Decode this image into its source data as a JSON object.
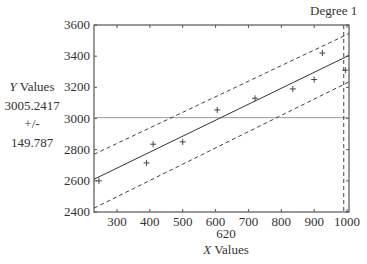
{
  "header": {
    "degree_label": "Degree 1"
  },
  "readout": {
    "y_axis_label_italic": "Y",
    "y_axis_label_rest": " Values",
    "y_value": "3005.2417",
    "plus_minus": "+/-",
    "y_interval": "149.787",
    "x_value": "620",
    "x_axis_label_italic": "X",
    "x_axis_label_rest": " Values"
  },
  "colors": {
    "axis": "#555555",
    "fit": "#333333",
    "bounds": "#444444",
    "crosshair": "#9a9a9a",
    "marker": "#333333"
  },
  "chart_data": {
    "type": "scatter",
    "title": "Degree 1",
    "xlabel": "X Values",
    "ylabel": "Y Values",
    "xlim": [
      230,
      1006
    ],
    "ylim": [
      2400,
      3600
    ],
    "x_ticks": [
      300,
      400,
      500,
      600,
      700,
      800,
      900,
      1000
    ],
    "y_ticks": [
      2400,
      2600,
      2800,
      3000,
      3200,
      3400,
      3600
    ],
    "grid": false,
    "series": [
      {
        "name": "data",
        "marker": "+",
        "x": [
          245,
          390,
          410,
          500,
          605,
          720,
          835,
          900,
          925,
          995
        ],
        "y": [
          2600,
          2715,
          2835,
          2850,
          3055,
          3130,
          3190,
          3250,
          3420,
          3310
        ]
      },
      {
        "name": "fit",
        "style": "solid",
        "x": [
          230,
          1006
        ],
        "y": [
          2610,
          3405
        ]
      },
      {
        "name": "upper bound",
        "style": "dashed",
        "x": [
          230,
          1006
        ],
        "y": [
          2770,
          3545
        ]
      },
      {
        "name": "lower bound",
        "style": "dashed",
        "x": [
          230,
          1006
        ],
        "y": [
          2425,
          3235
        ]
      }
    ],
    "crosshair": {
      "horizontal_y": 3005.2417,
      "vertical_x": 990,
      "x_readout": 620,
      "y_readout": 3005.2417,
      "y_interval": 149.787
    }
  }
}
